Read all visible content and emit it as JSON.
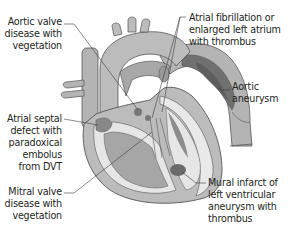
{
  "diagram": {
    "type": "anatomical illustration",
    "colors": {
      "tissue_light": "#bdbdbd",
      "tissue_mid": "#a3a3a3",
      "tissue_dark": "#6f6f6f",
      "chamber_inner": "#e6e6e6",
      "outline": "#555555",
      "leader_line": "#3a3a3a",
      "text": "#231f20",
      "background": "#ffffff"
    },
    "labels": [
      {
        "id": "aortic-valve",
        "lines": [
          "Aortic valve",
          "disease with",
          "vegetation"
        ]
      },
      {
        "id": "atrial-fibrillation",
        "lines": [
          "Atrial fibrillation or",
          "enlarged left atrium",
          "with thrombus"
        ]
      },
      {
        "id": "aortic-aneurysm",
        "lines": [
          "Aortic",
          "aneurysm"
        ]
      },
      {
        "id": "atrial-septal-defect",
        "lines": [
          "Atrial septal",
          "defect with",
          "paradoxical",
          "embolus",
          "from DVT"
        ]
      },
      {
        "id": "mitral-valve",
        "lines": [
          "Mitral valve",
          "disease with",
          "vegetation"
        ]
      },
      {
        "id": "mural-infarct",
        "lines": [
          "Mural infarct of",
          "left ventricular",
          "aneurysm with",
          "thrombus"
        ]
      }
    ]
  }
}
